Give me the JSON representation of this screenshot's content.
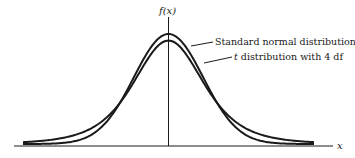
{
  "figure": {
    "y_axis_label": "f(x)",
    "x_axis_label": "x",
    "annotations": [
      {
        "text": "Standard normal distribution",
        "target": "normal-curve"
      },
      {
        "text_italic": "t",
        "text": " distribution with 4 df",
        "target": "t-curve"
      }
    ],
    "colors": {
      "line": "#1a1a1a",
      "background": "#ffffff"
    }
  },
  "chart_data": {
    "type": "line",
    "title": "",
    "xlabel": "x",
    "ylabel": "f(x)",
    "grid": false,
    "legend": "callout annotations, upper right",
    "series": [
      {
        "name": "Standard normal distribution",
        "peak_density": 0.3989,
        "dist": "N(0,1)"
      },
      {
        "name": "t distribution with 4 df",
        "peak_density": 0.375,
        "dist": "t(4)"
      }
    ],
    "x_range": [
      -4,
      4
    ],
    "ticks": []
  }
}
